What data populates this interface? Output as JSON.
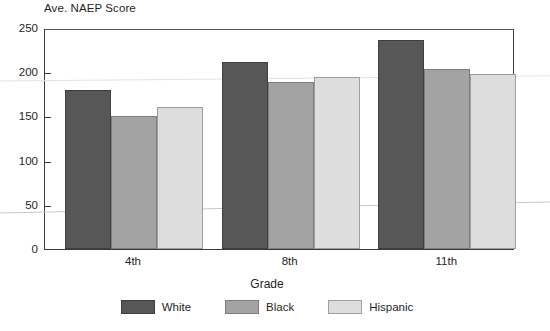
{
  "chart_data": {
    "type": "bar",
    "title": "",
    "ylabel": "Ave. NAEP Score",
    "xlabel": "Grade",
    "categories": [
      "4th",
      "8th",
      "11th"
    ],
    "series": [
      {
        "name": "White",
        "color": "#575757",
        "values": [
          180,
          212,
          237
        ]
      },
      {
        "name": "Black",
        "color": "#a3a3a3",
        "values": [
          150,
          189,
          204
        ]
      },
      {
        "name": "Hispanic",
        "color": "#dddddd",
        "values": [
          161,
          195,
          198
        ]
      }
    ],
    "ylim": [
      0,
      250
    ],
    "yticks": [
      0,
      50,
      100,
      150,
      200,
      250
    ],
    "ytick_labels": [
      "0",
      "50",
      "100",
      "150",
      "200",
      "250"
    ],
    "grid": false,
    "legend_position": "bottom"
  },
  "axes": {
    "y_title": "Ave. NAEP Score",
    "x_title": "Grade"
  }
}
